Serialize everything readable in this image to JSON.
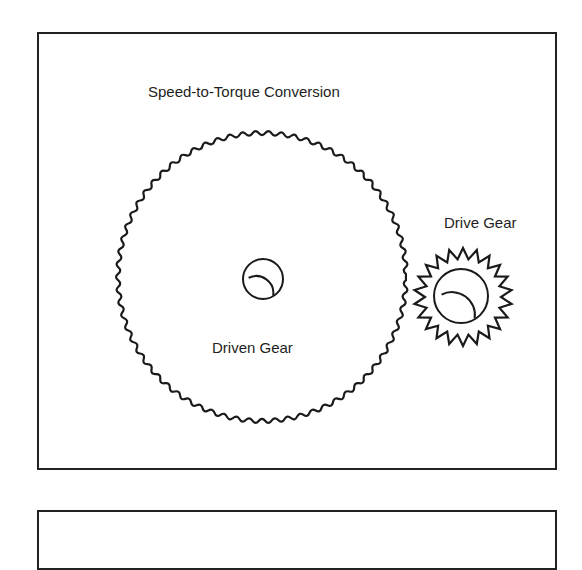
{
  "diagram": {
    "title": "Speed-to-Torque Conversion",
    "stroke_color": "#1a1a1a",
    "frame_color": "#222222",
    "gears": [
      {
        "id": "driven-gear",
        "label": "Driven Gear",
        "center": [
          262,
          277
        ],
        "outer_radius": 148,
        "root_radius": 140,
        "teeth": 70,
        "hub": {
          "center": [
            263,
            279
          ],
          "radius": 20,
          "inner_arc": true
        }
      },
      {
        "id": "drive-gear",
        "label": "Drive Gear",
        "center": [
          463,
          297
        ],
        "outer_radius": 49,
        "root_radius": 38,
        "teeth": 22,
        "hub": {
          "center": [
            461,
            296
          ],
          "radius": 27,
          "inner_arc": true
        }
      }
    ]
  },
  "labels": {
    "title": "Speed-to-Torque Conversion",
    "driven": "Driven Gear",
    "drive": "Drive Gear"
  }
}
